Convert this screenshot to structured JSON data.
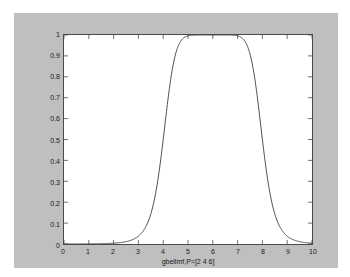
{
  "figure": {
    "background_color": "#bfbfbf",
    "axes_background_color": "#ffffff",
    "axes_border_color": "#4a4a4a",
    "curve_color": "#3a3a3a"
  },
  "chart_data": {
    "type": "line",
    "title": "",
    "subtitle": "",
    "xlabel": "gbellmf,P=[2 4 6]",
    "ylabel": "",
    "xlim": [
      0,
      10
    ],
    "ylim": [
      0,
      1
    ],
    "grid": false,
    "legend": [],
    "legend_position": "none",
    "tick_direction": "in",
    "box": true,
    "xticks": [
      0,
      1,
      2,
      3,
      4,
      5,
      6,
      7,
      8,
      9,
      10
    ],
    "xticklabels": [
      "0",
      "1",
      "2",
      "3",
      "4",
      "5",
      "6",
      "7",
      "8",
      "9",
      "10"
    ],
    "yticks": [
      0,
      0.1,
      0.2,
      0.3,
      0.4,
      0.5,
      0.6,
      0.7,
      0.8,
      0.9,
      1
    ],
    "yticklabels": [
      "0",
      "0.1",
      "0.2",
      "0.3",
      "0.4",
      "0.5",
      "0.6",
      "0.7",
      "0.8",
      "0.9",
      "1"
    ],
    "function": "gbellmf",
    "parameters": {
      "a": 2,
      "b": 4,
      "c": 6
    },
    "formula": "y = 1 / (1 + |(x - 6) / 2|^(2*4))",
    "series": [
      {
        "name": "gbellmf,P=[2 4 6]",
        "color": "#3a3a3a",
        "x": [
          0,
          0.2,
          0.4,
          0.6,
          0.8,
          1,
          1.2,
          1.4,
          1.6,
          1.8,
          2,
          2.2,
          2.4,
          2.6,
          2.8,
          3,
          3.2,
          3.4,
          3.6,
          3.8,
          4,
          4.2,
          4.4,
          4.6,
          4.8,
          5,
          5.2,
          5.4,
          5.6,
          5.8,
          6,
          6.2,
          6.4,
          6.6,
          6.8,
          7,
          7.2,
          7.4,
          7.6,
          7.8,
          8,
          8.2,
          8.4,
          8.6,
          8.8,
          9,
          9.2,
          9.4,
          9.6,
          9.8,
          10
        ],
        "y": [
          0.0002,
          0.0003,
          0.0004,
          0.0006,
          0.0008,
          0.0012,
          0.0017,
          0.0024,
          0.0035,
          0.0051,
          0.0077,
          0.0117,
          0.0182,
          0.029,
          0.0477,
          0.0807,
          0.1403,
          0.2479,
          0.4331,
          0.6897,
          0.5,
          0.8934,
          0.958,
          0.9848,
          0.9954,
          0.9985,
          0.9996,
          0.9999,
          1.0,
          1.0,
          1.0,
          1.0,
          1.0,
          0.9999,
          0.9996,
          0.9985,
          0.9954,
          0.9848,
          0.958,
          0.8934,
          0.5,
          0.6897,
          0.4331,
          0.2479,
          0.1403,
          0.0807,
          0.0477,
          0.029,
          0.0182,
          0.0117,
          0.0077
        ]
      }
    ]
  },
  "xlabel_text": "gbellmf,P=[2 4 6]"
}
